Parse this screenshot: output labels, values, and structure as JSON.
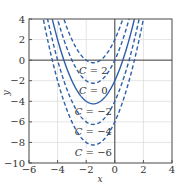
{
  "chart_data": {
    "type": "line",
    "title": "",
    "xlabel": "x",
    "ylabel": "y",
    "xlim": [
      -6,
      4
    ],
    "ylim": [
      -10,
      4
    ],
    "xticks": [
      -6,
      -4,
      -2,
      0,
      2,
      4
    ],
    "yticks": [
      4,
      2,
      0,
      -2,
      -4,
      -6,
      -8,
      -10
    ],
    "xtick_labels": [
      "−6",
      "−4",
      "−2",
      "0",
      "2",
      "4"
    ],
    "ytick_labels": [
      "4",
      "2",
      "0",
      "−2",
      "−4",
      "−6",
      "−8",
      "−10"
    ],
    "grid": true,
    "function": "y = x^2 + 3x + C",
    "series": [
      {
        "name": "C = 2",
        "C": 2,
        "style": "dashed",
        "vertex": [
          -1.5,
          -0.25
        ]
      },
      {
        "name": "C = 0",
        "C": 0,
        "style": "dashed",
        "vertex": [
          -1.5,
          -2.25
        ]
      },
      {
        "name": "C = −2",
        "C": -2,
        "style": "solid",
        "vertex": [
          -1.5,
          -4.25
        ]
      },
      {
        "name": "C = −4",
        "C": -4,
        "style": "dashed",
        "vertex": [
          -1.5,
          -6.25
        ]
      },
      {
        "name": "C = −6",
        "C": -6,
        "style": "dashed",
        "vertex": [
          -1.5,
          -8.25
        ]
      }
    ],
    "annotations": [
      "C = 2",
      "C = 0",
      "C = −2",
      "C = −4",
      "C = −6"
    ],
    "colors": {
      "curve": "#2e5fa8",
      "axis": "#333333",
      "grid": "#d8d8d8"
    }
  }
}
